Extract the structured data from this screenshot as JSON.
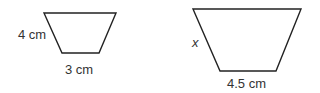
{
  "figure": {
    "small_trapezoid": {
      "side_label": "4 cm",
      "base_label": "3 cm",
      "points": "44,13 116,13 99,53 62,53"
    },
    "large_trapezoid": {
      "side_label": "x",
      "base_label": "4.5 cm",
      "points": "193,9 301,9 276,71 220,71"
    },
    "stroke_color": "#222222"
  }
}
